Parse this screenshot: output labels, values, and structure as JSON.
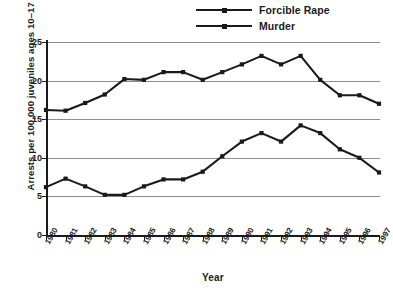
{
  "chart_data": {
    "type": "line",
    "title": "",
    "xlabel": "Year",
    "ylabel": "Arrests per 100,000 juveniles ages 10–17",
    "categories": [
      "1980",
      "1981",
      "1982",
      "1983",
      "1984",
      "1985",
      "1986",
      "1987",
      "1988",
      "1989",
      "1990",
      "1991",
      "1992",
      "1993",
      "1994",
      "1995",
      "1996",
      "1997"
    ],
    "x": [
      1980,
      1981,
      1982,
      1983,
      1984,
      1985,
      1986,
      1987,
      1988,
      1989,
      1990,
      1991,
      1992,
      1993,
      1994,
      1995,
      1996,
      1997
    ],
    "series": [
      {
        "name": "Forcible Rape",
        "values": [
          16.2,
          16.1,
          17.1,
          18.2,
          20.2,
          20.1,
          21.1,
          21.1,
          20.1,
          21.1,
          22.1,
          23.2,
          22.1,
          23.2,
          20.1,
          18.1,
          18.1,
          17.0
        ],
        "color": "#1a1a1a",
        "marker": "square"
      },
      {
        "name": "Murder",
        "values": [
          6.2,
          7.3,
          6.3,
          5.2,
          5.2,
          6.3,
          7.2,
          7.2,
          8.2,
          10.2,
          12.1,
          13.2,
          12.1,
          14.2,
          13.2,
          11.1,
          10.0,
          8.1
        ],
        "color": "#1a1a1a",
        "marker": "square"
      }
    ],
    "ylim": [
      0,
      25
    ],
    "yticks": [
      0,
      5,
      10,
      15,
      20,
      25
    ],
    "ytick_labels": [
      "0",
      "5",
      "10",
      "15",
      "20",
      "25"
    ],
    "grid": true,
    "grid_axis": "y",
    "legend_position": "top-center"
  },
  "legend": {
    "items": [
      {
        "label": "Forcible Rape"
      },
      {
        "label": "Murder"
      }
    ]
  },
  "axes": {
    "y_title": "Arrests per 100,000 juveniles ages 10–17",
    "x_title": "Year"
  },
  "colors": {
    "line": "#1a1a1a",
    "grid": "#8c8c8c",
    "axis": "#1a1a1a",
    "background": "#ffffff"
  }
}
